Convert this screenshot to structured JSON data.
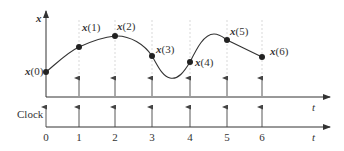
{
  "diagram": {
    "upper_axis": {
      "y_label": "x",
      "x_label": "t"
    },
    "lower_axis": {
      "y_label": "Clock",
      "x_label": "t"
    },
    "tick_labels": [
      "0",
      "1",
      "2",
      "3",
      "4",
      "5",
      "6"
    ],
    "samples": [
      {
        "name": "x",
        "index": "(0)"
      },
      {
        "name": "x",
        "index": "(1)"
      },
      {
        "name": "x",
        "index": "(2)"
      },
      {
        "name": "x",
        "index": "(3)"
      },
      {
        "name": "x",
        "index": "(4)"
      },
      {
        "name": "x",
        "index": "(5)"
      },
      {
        "name": "x",
        "index": "(6)"
      }
    ],
    "colors": {
      "line": "#333333",
      "guide": "#bbbbbb",
      "point": "#222222"
    }
  }
}
